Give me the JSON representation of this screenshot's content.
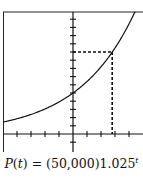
{
  "chart_data": {
    "type": "line",
    "title": "",
    "caption": "P(t) = (50,000)1.025^t",
    "function": "P(t) = 50000 * 1.025^t",
    "xlabel": "t",
    "ylabel": "P",
    "xlim": [
      -50,
      48
    ],
    "ylim": [
      -10000,
      150000
    ],
    "x_tick_step": 10,
    "y_tick_step": 10000,
    "grid": false,
    "tick_labels": false,
    "series": [
      {
        "name": "P(t)",
        "x": [
          -50,
          -40,
          -30,
          -20,
          -10,
          0,
          10,
          20,
          28,
          30,
          40,
          46
        ],
        "values": [
          14550,
          18620,
          23840,
          30510,
          39060,
          50000,
          64000,
          81930,
          100000,
          104880,
          134250,
          155000
        ]
      }
    ],
    "annotations": [
      {
        "type": "dashed-guide",
        "x": 28,
        "y": 100000,
        "label": "doubling point (P = 100,000)"
      }
    ],
    "y_intercept": 50000
  },
  "caption": {
    "lhs_fn": "P",
    "lhs_var": "t",
    "rhs": " = (50,000)1.025",
    "exponent": "t"
  },
  "colors": {
    "line": "#111111",
    "background": "#ffffff"
  }
}
